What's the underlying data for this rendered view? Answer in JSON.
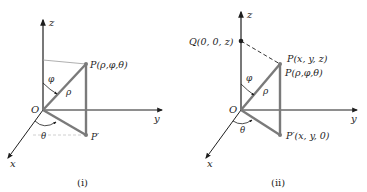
{
  "colors": {
    "axis": "#1e1e1e",
    "thick_segment": "#7a7a7a",
    "thin_guide": "#9a9a9a",
    "background": "#ffffff"
  },
  "panels": [
    {
      "caption": "(i)",
      "axes": {
        "z": "z",
        "y": "y",
        "x": "x"
      },
      "origin_label": "O",
      "point_label": "P(ρ,φ,θ)",
      "projection_label": "P′",
      "angle_polar": "φ",
      "angle_azimuth": "θ",
      "radius_label": "ρ"
    },
    {
      "caption": "(ii)",
      "axes": {
        "z": "z",
        "y": "y",
        "x": "x"
      },
      "origin_label": "O",
      "q_label": "Q(0, 0, z)",
      "point_label_cartesian": "P(x, y, z)",
      "point_label_spherical": "P(ρ,φ,θ)",
      "projection_label": "P′(x, y, 0)",
      "angle_polar": "φ",
      "angle_azimuth": "θ",
      "radius_label": "ρ"
    }
  ]
}
